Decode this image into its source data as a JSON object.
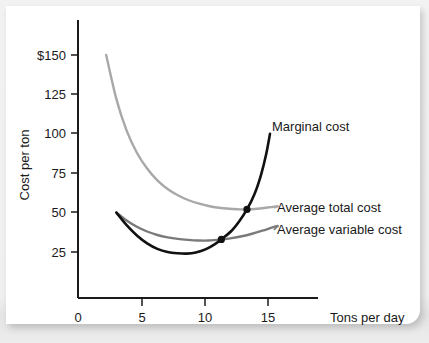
{
  "chart_data": {
    "type": "line",
    "title": "",
    "xlabel": "Tons per day",
    "ylabel": "Cost per ton",
    "xlim": [
      0,
      18
    ],
    "ylim": [
      0,
      165
    ],
    "grid": false,
    "legend_position": "inline-right",
    "xticks": [
      "0",
      "5",
      "10",
      "15"
    ],
    "xtick_values": [
      0,
      5,
      10,
      15
    ],
    "yticks": [
      "$150",
      "125",
      "100",
      "75",
      "50",
      "25"
    ],
    "ytick_values": [
      150,
      125,
      100,
      75,
      50,
      25
    ],
    "series": [
      {
        "name": "Marginal cost",
        "color": "#111111",
        "x": [
          3.0,
          3.8,
          4.6,
          5.4,
          6.2,
          7.0,
          7.8,
          8.5,
          9.2,
          10.0,
          10.7,
          11.2,
          12.0,
          12.6,
          13.2,
          13.8,
          14.3,
          14.7,
          15.0
        ],
        "y": [
          50.0,
          42.0,
          35.5,
          30.5,
          27.0,
          25.0,
          24.2,
          24.0,
          24.7,
          26.8,
          30.0,
          33.0,
          38.5,
          44.5,
          52.0,
          62.0,
          74.0,
          87.0,
          100.0
        ]
      },
      {
        "name": "Average total cost",
        "color": "#a8a8a8",
        "x": [
          2.2,
          3.0,
          3.8,
          4.6,
          5.4,
          6.2,
          7.0,
          7.8,
          8.6,
          9.4,
          10.2,
          11.0,
          11.8,
          12.5,
          13.2,
          14.0,
          14.8,
          15.6
        ],
        "y": [
          150.0,
          122.0,
          102.0,
          88.0,
          78.0,
          70.5,
          65.0,
          61.0,
          58.0,
          55.8,
          54.2,
          53.1,
          52.4,
          52.1,
          52.0,
          52.4,
          53.2,
          54.0
        ]
      },
      {
        "name": "Average variable cost",
        "color": "#7a7a7a",
        "x": [
          3.0,
          3.8,
          4.6,
          5.4,
          6.2,
          7.0,
          7.8,
          8.6,
          9.4,
          10.2,
          11.2,
          12.0,
          12.8,
          13.6,
          14.4,
          15.2,
          15.6
        ],
        "y": [
          50.0,
          45.0,
          41.0,
          38.0,
          35.8,
          34.3,
          33.3,
          32.7,
          32.3,
          32.3,
          33.0,
          33.8,
          35.0,
          36.6,
          38.5,
          40.6,
          41.5
        ]
      }
    ],
    "annotations": [
      {
        "name": "mc-avc-intersection",
        "label": "",
        "x": 11.2,
        "y": 33.0,
        "marker": "dot",
        "color": "#111111"
      },
      {
        "name": "mc-atc-intersection",
        "label": "",
        "x": 13.2,
        "y": 52.0,
        "marker": "dot",
        "color": "#111111"
      }
    ],
    "curve_labels": [
      {
        "text": "Marginal cost",
        "series": "Marginal cost"
      },
      {
        "text": "Average total cost",
        "series": "Average total cost"
      },
      {
        "text": "Average variable cost",
        "series": "Average variable cost"
      }
    ]
  }
}
